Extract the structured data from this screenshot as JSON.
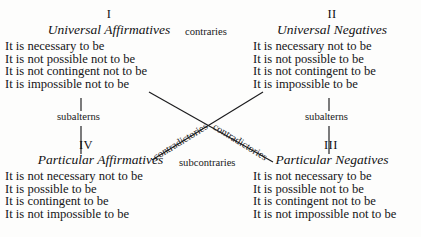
{
  "figure": {
    "background_color": "#fdfdfc",
    "ink_color": "#18181a"
  },
  "quadrants": [
    {
      "numeral": "I",
      "category": "Universal Affirmatives",
      "propositions": [
        "It is necessary to be",
        "It is not possible not to be",
        "It is not contingent not to be",
        "It is impossible not to be"
      ]
    },
    {
      "numeral": "II",
      "category": "Universal Negatives",
      "propositions": [
        "It is necessary not to be",
        "It is not possible to be",
        "It is not contingent to be",
        "It is impossible to be"
      ]
    },
    {
      "numeral": "III",
      "category": "Particular Negatives",
      "propositions": [
        "It is not necessary to be",
        "It is possible not to be",
        "It is contingent not to be",
        "It is not impossible not to be"
      ]
    },
    {
      "numeral": "IV",
      "category": "Particular Affirmatives",
      "propositions": [
        "It is not necessary not to be",
        "It is possible to be",
        "It is contingent to be",
        "It is not impossible to be"
      ]
    }
  ],
  "relations": {
    "contraries": "contraries",
    "subcontraries": "subcontraries",
    "subalterns_left": "subalterns",
    "subalterns_right": "subalterns",
    "contradictories_left": "contradictories",
    "contradictories_right": "contradictories"
  }
}
